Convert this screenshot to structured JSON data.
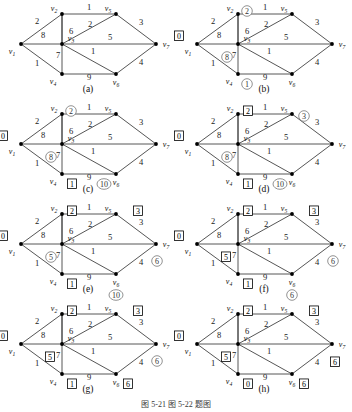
{
  "figure": {
    "caption": "图 5-21    图 5-22 题图",
    "panel_size": {
      "w": 176,
      "h": 100
    }
  },
  "graph": {
    "nodes": [
      {
        "id": "v1",
        "label": "v",
        "sub": "1",
        "x": 21,
        "y": 44,
        "label_dx": -9,
        "label_dy": 10
      },
      {
        "id": "v2",
        "label": "v",
        "sub": "2",
        "x": 62,
        "y": 14,
        "label_dx": -8,
        "label_dy": -3
      },
      {
        "id": "v3",
        "label": "v",
        "sub": "3",
        "x": 62,
        "y": 44,
        "label_dx": 9,
        "label_dy": -3
      },
      {
        "id": "v4",
        "label": "v",
        "sub": "4",
        "x": 62,
        "y": 74,
        "label_dx": -9,
        "label_dy": 10
      },
      {
        "id": "v5",
        "label": "v",
        "sub": "5",
        "x": 116,
        "y": 14,
        "label_dx": -8,
        "label_dy": -3
      },
      {
        "id": "v6",
        "label": "v",
        "sub": "6",
        "x": 116,
        "y": 74,
        "label_dx": 0,
        "label_dy": 11
      },
      {
        "id": "v7",
        "label": "v",
        "sub": "7",
        "x": 156,
        "y": 44,
        "label_dx": 10,
        "label_dy": 3
      }
    ],
    "edges": [
      {
        "from": "v1",
        "to": "v2",
        "weight": "2",
        "lx": 37,
        "ly": 24
      },
      {
        "from": "v1",
        "to": "v3",
        "weight": "8",
        "lx": 43,
        "ly": 38
      },
      {
        "from": "v1",
        "to": "v4",
        "weight": "1",
        "lx": 37,
        "ly": 66
      },
      {
        "from": "v2",
        "to": "v5",
        "weight": "1",
        "lx": 89,
        "ly": 10
      },
      {
        "from": "v2",
        "to": "v3",
        "weight": "7",
        "lx": 58,
        "ly": 58
      },
      {
        "from": "v3",
        "to": "v2",
        "weight": "6",
        "lx": 71,
        "ly": 34
      },
      {
        "from": "v3",
        "to": "v5",
        "weight": "2",
        "lx": 90,
        "ly": 27
      },
      {
        "from": "v3",
        "to": "v7",
        "weight": "5",
        "lx": 110,
        "ly": 40
      },
      {
        "from": "v3",
        "to": "v6",
        "weight": "1",
        "lx": 93,
        "ly": 54
      },
      {
        "from": "v3",
        "to": "v4",
        "weight": "7",
        "lx": 58,
        "ly": 58
      },
      {
        "from": "v4",
        "to": "v6",
        "weight": "9",
        "lx": 89,
        "ly": 80
      },
      {
        "from": "v5",
        "to": "v7",
        "weight": "3",
        "lx": 141,
        "ly": 25
      },
      {
        "from": "v6",
        "to": "v7",
        "weight": "4",
        "lx": 141,
        "ly": 65
      }
    ]
  },
  "panels": [
    {
      "id": "a",
      "caption": "(a)",
      "labels": []
    },
    {
      "id": "b",
      "caption": "(b)",
      "labels": [
        {
          "node": "v1",
          "value": "0",
          "style": "box",
          "dx": -18,
          "dy": -8
        },
        {
          "node": "v2",
          "value": "2",
          "style": "circle",
          "dx": 9,
          "dy": -3
        },
        {
          "node": "v3",
          "value": "8",
          "style": "circle",
          "dx": -11,
          "dy": 13
        },
        {
          "node": "v4",
          "value": "1",
          "style": "circle",
          "dx": 9,
          "dy": 10
        }
      ]
    },
    {
      "id": "c",
      "caption": "(c)",
      "labels": [
        {
          "node": "v1",
          "value": "0",
          "style": "box",
          "dx": -18,
          "dy": -8
        },
        {
          "node": "v2",
          "value": "2",
          "style": "circle",
          "dx": 9,
          "dy": -3
        },
        {
          "node": "v3",
          "value": "8",
          "style": "circle",
          "dx": -11,
          "dy": 13
        },
        {
          "node": "v4",
          "value": "1",
          "style": "box",
          "dx": 10,
          "dy": 10
        },
        {
          "node": "v6",
          "value": "10",
          "style": "circle",
          "dx": -12,
          "dy": 10
        }
      ]
    },
    {
      "id": "d",
      "caption": "(d)",
      "labels": [
        {
          "node": "v1",
          "value": "0",
          "style": "box",
          "dx": -18,
          "dy": -8
        },
        {
          "node": "v2",
          "value": "2",
          "style": "box",
          "dx": 10,
          "dy": -3
        },
        {
          "node": "v3",
          "value": "8",
          "style": "circle",
          "dx": -11,
          "dy": 13
        },
        {
          "node": "v4",
          "value": "1",
          "style": "box",
          "dx": 10,
          "dy": 10
        },
        {
          "node": "v5",
          "value": "3",
          "style": "circle",
          "dx": 12,
          "dy": 2
        },
        {
          "node": "v6",
          "value": "10",
          "style": "circle",
          "dx": -12,
          "dy": 10
        }
      ]
    },
    {
      "id": "e",
      "caption": "(e)",
      "labels": [
        {
          "node": "v1",
          "value": "0",
          "style": "box",
          "dx": -18,
          "dy": -8
        },
        {
          "node": "v2",
          "value": "2",
          "style": "box",
          "dx": 10,
          "dy": -3
        },
        {
          "node": "v3",
          "value": "5",
          "style": "circle",
          "dx": -11,
          "dy": 13
        },
        {
          "node": "v4",
          "value": "1",
          "style": "box",
          "dx": 10,
          "dy": 10
        },
        {
          "node": "v5",
          "value": "3",
          "style": "box",
          "dx": 22,
          "dy": -3
        },
        {
          "node": "v6",
          "value": "10",
          "style": "circle",
          "dx": 0,
          "dy": 21
        },
        {
          "node": "v7",
          "value": "6",
          "style": "circle",
          "dx": 1,
          "dy": 17
        }
      ]
    },
    {
      "id": "f",
      "caption": "(f)",
      "labels": [
        {
          "node": "v1",
          "value": "0",
          "style": "box",
          "dx": -18,
          "dy": -8
        },
        {
          "node": "v2",
          "value": "2",
          "style": "box",
          "dx": 10,
          "dy": -3
        },
        {
          "node": "v3",
          "value": "5",
          "style": "box",
          "dx": -12,
          "dy": 13
        },
        {
          "node": "v4",
          "value": "1",
          "style": "box",
          "dx": 10,
          "dy": 10
        },
        {
          "node": "v5",
          "value": "3",
          "style": "box",
          "dx": 22,
          "dy": -3
        },
        {
          "node": "v6",
          "value": "6",
          "style": "circle",
          "dx": 0,
          "dy": 21
        },
        {
          "node": "v7",
          "value": "6",
          "style": "circle",
          "dx": 1,
          "dy": 17
        }
      ]
    },
    {
      "id": "g",
      "caption": "(g)",
      "labels": [
        {
          "node": "v1",
          "value": "0",
          "style": "box",
          "dx": -18,
          "dy": -8
        },
        {
          "node": "v2",
          "value": "2",
          "style": "box",
          "dx": 10,
          "dy": -3
        },
        {
          "node": "v3",
          "value": "5",
          "style": "box",
          "dx": -12,
          "dy": 13
        },
        {
          "node": "v4",
          "value": "1",
          "style": "box",
          "dx": 10,
          "dy": 10
        },
        {
          "node": "v5",
          "value": "3",
          "style": "box",
          "dx": 22,
          "dy": -3
        },
        {
          "node": "v6",
          "value": "6",
          "style": "box",
          "dx": 12,
          "dy": 10
        },
        {
          "node": "v7",
          "value": "6",
          "style": "circle",
          "dx": 1,
          "dy": 17
        }
      ]
    },
    {
      "id": "h",
      "caption": "(h)",
      "labels": [
        {
          "node": "v1",
          "value": "0",
          "style": "box",
          "dx": -18,
          "dy": -8
        },
        {
          "node": "v2",
          "value": "2",
          "style": "box",
          "dx": 10,
          "dy": -3
        },
        {
          "node": "v3",
          "value": "5",
          "style": "box",
          "dx": -12,
          "dy": 13
        },
        {
          "node": "v4",
          "value": "0",
          "style": "box",
          "dx": 10,
          "dy": 10
        },
        {
          "node": "v5",
          "value": "3",
          "style": "box",
          "dx": 22,
          "dy": -3
        },
        {
          "node": "v6",
          "value": "6",
          "style": "box",
          "dx": 12,
          "dy": 10
        },
        {
          "node": "v7",
          "value": "6",
          "style": "box",
          "dx": 3,
          "dy": 18
        }
      ]
    }
  ]
}
